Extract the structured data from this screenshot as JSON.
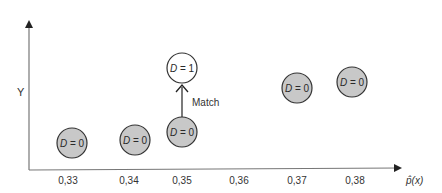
{
  "diagram": {
    "y_axis_label": "Y",
    "x_axis_label": "p̂(x)",
    "x_ticks": [
      "0,33",
      "0,34",
      "0,35",
      "0,36",
      "0,37",
      "0,38"
    ],
    "arrow_label": "Match",
    "colors": {
      "treated_fill": "#ffffff",
      "control_fill": "#c8c8c8",
      "stroke": "#333333",
      "axis": "#555555"
    },
    "nodes": [
      {
        "id": "n1",
        "x_tick": "0,33",
        "label_var": "D",
        "label_val": "0",
        "treated": false
      },
      {
        "id": "n2",
        "x_tick": "0,34",
        "label_var": "D",
        "label_val": "0",
        "treated": false
      },
      {
        "id": "n3",
        "x_tick": "0,35",
        "label_var": "D",
        "label_val": "0",
        "treated": false
      },
      {
        "id": "n4",
        "x_tick": "0,35",
        "label_var": "D",
        "label_val": "1",
        "treated": true
      },
      {
        "id": "n5",
        "x_tick": "0,37",
        "label_var": "D",
        "label_val": "0",
        "treated": false
      },
      {
        "id": "n6",
        "x_tick": "0,38",
        "label_var": "D",
        "label_val": "0",
        "treated": false
      }
    ],
    "edges": [
      {
        "from": "n3",
        "to": "n4",
        "label": "Match"
      }
    ]
  }
}
